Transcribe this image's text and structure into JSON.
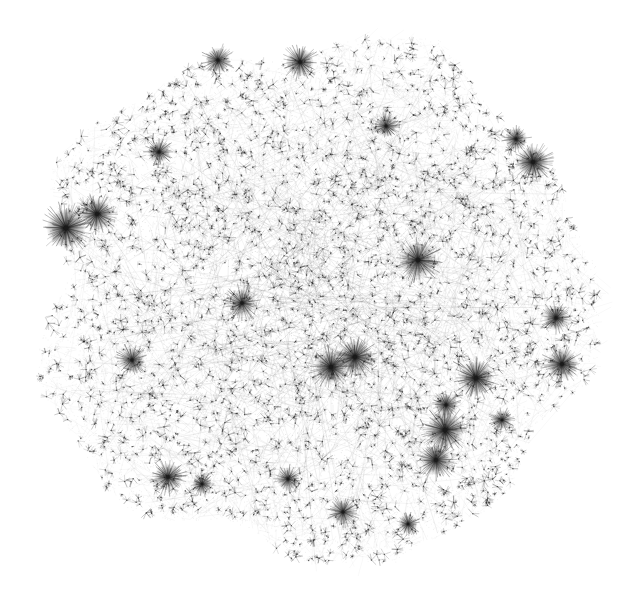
{
  "diagram": {
    "type": "network-graph",
    "background": "#ffffff",
    "ink": "#1a1a1a",
    "canvas": {
      "width": 628,
      "height": 602
    },
    "cloud": {
      "center": [
        318,
        300
      ],
      "radius_x": 280,
      "radius_y": 262,
      "lobes": [
        [
          30,
          228,
          14
        ],
        [
          205,
          560,
          10
        ],
        [
          330,
          40,
          8
        ],
        [
          590,
          330,
          12
        ]
      ]
    },
    "hubs": [
      {
        "x": 66,
        "y": 228,
        "size": 14,
        "dark": 0.95
      },
      {
        "x": 97,
        "y": 214,
        "size": 11,
        "dark": 0.9
      },
      {
        "x": 300,
        "y": 62,
        "size": 10,
        "dark": 0.85
      },
      {
        "x": 533,
        "y": 162,
        "size": 11,
        "dark": 0.9
      },
      {
        "x": 516,
        "y": 139,
        "size": 8,
        "dark": 0.8
      },
      {
        "x": 418,
        "y": 260,
        "size": 13,
        "dark": 0.8
      },
      {
        "x": 355,
        "y": 357,
        "size": 12,
        "dark": 0.95
      },
      {
        "x": 331,
        "y": 367,
        "size": 12,
        "dark": 0.95
      },
      {
        "x": 476,
        "y": 378,
        "size": 12,
        "dark": 0.9
      },
      {
        "x": 445,
        "y": 430,
        "size": 13,
        "dark": 0.95
      },
      {
        "x": 436,
        "y": 460,
        "size": 11,
        "dark": 0.9
      },
      {
        "x": 446,
        "y": 405,
        "size": 8,
        "dark": 0.85
      },
      {
        "x": 562,
        "y": 364,
        "size": 11,
        "dark": 0.85
      },
      {
        "x": 556,
        "y": 318,
        "size": 9,
        "dark": 0.85
      },
      {
        "x": 168,
        "y": 477,
        "size": 10,
        "dark": 0.75
      },
      {
        "x": 218,
        "y": 60,
        "size": 9,
        "dark": 0.75
      },
      {
        "x": 159,
        "y": 152,
        "size": 8,
        "dark": 0.75
      },
      {
        "x": 343,
        "y": 512,
        "size": 9,
        "dark": 0.7
      },
      {
        "x": 242,
        "y": 303,
        "size": 10,
        "dark": 0.7
      },
      {
        "x": 132,
        "y": 360,
        "size": 9,
        "dark": 0.75
      },
      {
        "x": 202,
        "y": 484,
        "size": 7,
        "dark": 0.8
      },
      {
        "x": 408,
        "y": 524,
        "size": 7,
        "dark": 0.75
      },
      {
        "x": 288,
        "y": 479,
        "size": 8,
        "dark": 0.7
      },
      {
        "x": 502,
        "y": 420,
        "size": 7,
        "dark": 0.75
      },
      {
        "x": 386,
        "y": 126,
        "size": 8,
        "dark": 0.7
      }
    ],
    "edge_count": 5200,
    "leaf_count": 2600,
    "seed": 7331
  }
}
